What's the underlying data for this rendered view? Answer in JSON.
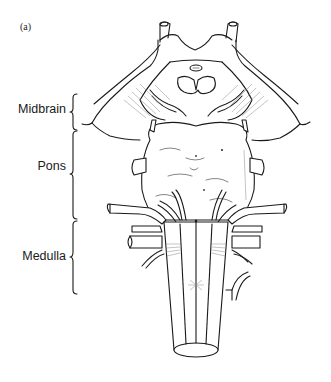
{
  "figure": {
    "panel_label": "(a)",
    "regions": [
      {
        "label": "Midbrain",
        "brace_top": 93,
        "brace_bottom": 130
      },
      {
        "label": "Pons",
        "brace_top": 130,
        "brace_bottom": 220
      },
      {
        "label": "Medulla",
        "brace_top": 220,
        "brace_bottom": 295
      }
    ]
  }
}
